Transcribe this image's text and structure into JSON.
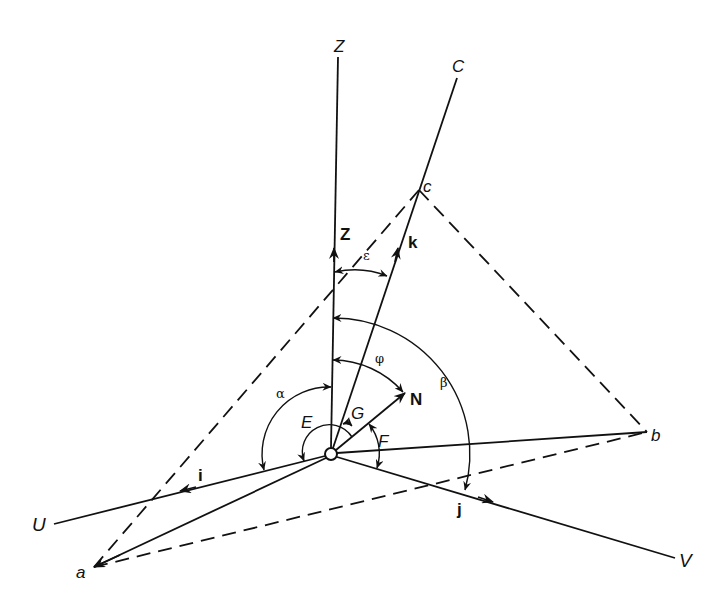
{
  "diagram": {
    "origin": {
      "x": 331,
      "y": 454,
      "r": 6
    },
    "axes": [
      {
        "id": "Z",
        "label": "Z",
        "end": [
          338,
          57
        ],
        "label_pos": [
          334,
          52
        ]
      },
      {
        "id": "C",
        "label": "C",
        "end": [
          457,
          78
        ],
        "label_pos": [
          452,
          72
        ]
      },
      {
        "id": "U",
        "label": "U",
        "end": [
          54,
          524
        ],
        "label_pos": [
          30,
          530
        ]
      },
      {
        "id": "V",
        "label": "V",
        "end": [
          675,
          558
        ],
        "label_pos": [
          679,
          568
        ]
      }
    ],
    "points": [
      {
        "id": "a",
        "label": "a",
        "pos": [
          94,
          567
        ],
        "label_pos": [
          76,
          578
        ]
      },
      {
        "id": "b",
        "label": "b",
        "pos": [
          647,
          432
        ],
        "label_pos": [
          652,
          442
        ]
      },
      {
        "id": "c",
        "label": "c",
        "pos": [
          419,
          190
        ],
        "label_pos": [
          423,
          190
        ]
      }
    ],
    "unit_vectors": [
      {
        "id": "Z",
        "label": "Z",
        "tip": [
          334,
          248
        ],
        "label_pos": [
          340,
          240
        ]
      },
      {
        "id": "k",
        "label": "k",
        "tip": [
          398,
          248
        ],
        "label_pos": [
          408,
          248
        ]
      },
      {
        "id": "i",
        "label": "i",
        "tip": [
          180,
          491
        ],
        "label_pos": [
          198,
          480
        ]
      },
      {
        "id": "j",
        "label": "j",
        "tip": [
          493,
          502
        ],
        "label_pos": [
          457,
          515
        ]
      },
      {
        "id": "N",
        "label": "N",
        "tip": [
          405,
          393
        ],
        "label_pos": [
          410,
          405
        ]
      }
    ],
    "angles": [
      {
        "id": "epsilon",
        "label": "ε",
        "label_pos": [
          363,
          260
        ]
      },
      {
        "id": "beta",
        "label": "β",
        "label_pos": [
          440,
          387
        ]
      },
      {
        "id": "phi",
        "label": "φ",
        "label_pos": [
          375,
          363
        ]
      },
      {
        "id": "alpha",
        "label": "α",
        "label_pos": [
          276,
          398
        ]
      },
      {
        "id": "E",
        "label": "E",
        "label_pos": [
          302,
          427
        ]
      },
      {
        "id": "G",
        "label": "G",
        "label_pos": [
          351,
          418
        ]
      },
      {
        "id": "F",
        "label": "F",
        "label_pos": [
          378,
          446
        ]
      }
    ],
    "dashed_edges": [
      [
        "a",
        "c"
      ],
      [
        "c",
        "b"
      ],
      [
        "a",
        "b"
      ]
    ],
    "solid_rays": [
      "a",
      "b"
    ]
  }
}
